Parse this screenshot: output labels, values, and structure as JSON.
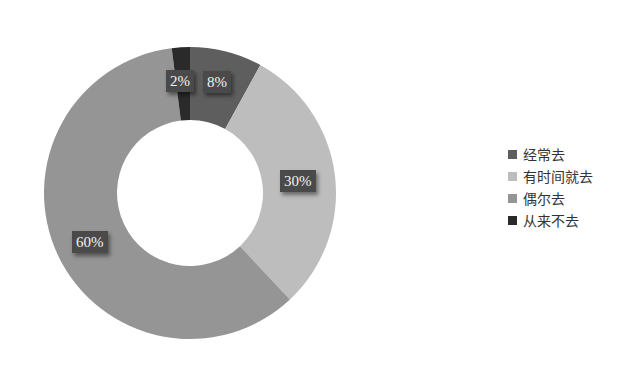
{
  "chart_data": {
    "type": "pie",
    "subtype": "donut",
    "title": "",
    "categories": [
      "经常去",
      "有时间就去",
      "偶尔去",
      "从来不去"
    ],
    "values": [
      8,
      30,
      60,
      2
    ],
    "labels": [
      "8%",
      "30%",
      "60%",
      "2%"
    ],
    "colors": [
      "#5e5e5e",
      "#bdbdbd",
      "#959595",
      "#2a2a2a"
    ],
    "legend_position": "right",
    "start_angle_deg": 0,
    "direction": "clockwise"
  },
  "legend": {
    "items": [
      {
        "label": "经常去",
        "color": "#5e5e5e"
      },
      {
        "label": "有时间就去",
        "color": "#bdbdbd"
      },
      {
        "label": "偶尔去",
        "color": "#959595"
      },
      {
        "label": "从来不去",
        "color": "#2a2a2a"
      }
    ]
  },
  "data_labels": {
    "often": "8%",
    "sometimes": "30%",
    "occasionally": "60%",
    "never": "2%"
  }
}
